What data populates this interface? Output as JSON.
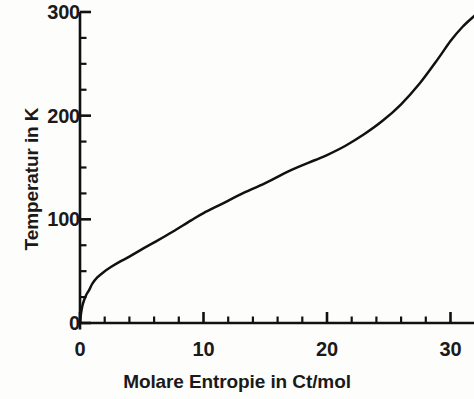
{
  "chart_data": {
    "type": "line",
    "title": "",
    "subtitle": "",
    "xlabel": "Molare Entropie in Ct/mol",
    "ylabel": "Temperatur in K",
    "xlim": [
      0,
      32
    ],
    "ylim": [
      0,
      300
    ],
    "grid": false,
    "legend": null,
    "x_major_ticks": [
      0,
      10,
      20,
      30
    ],
    "x_major_tick_labels": [
      "0",
      "10",
      "20",
      "30"
    ],
    "x_minor_tick_step": 2,
    "y_major_ticks": [
      0,
      100,
      200,
      300
    ],
    "y_major_tick_labels": [
      "0",
      "100",
      "200",
      "300"
    ],
    "y_minor_tick_step": 25,
    "line_color": "#111111",
    "background_color": "#fdfdfc",
    "axis_color": "#111111",
    "series": [
      {
        "name": "Temperatur gegen molare Entropie",
        "x": [
          0,
          0.08,
          0.18,
          0.3,
          0.5,
          0.75,
          1.0,
          1.4,
          1.9,
          2.5,
          3.2,
          4.0,
          5.0,
          6.2,
          7.5,
          9.0,
          10.0,
          11.5,
          13.0,
          15.0,
          17.0,
          19.0,
          20.0,
          21.5,
          23.0,
          24.5,
          26.0,
          27.5,
          29.0,
          30.0,
          31.0,
          32.0
        ],
        "y": [
          0,
          9,
          16,
          21,
          27,
          32,
          38,
          44,
          49,
          54,
          59,
          64,
          71,
          79,
          88,
          99,
          106,
          115,
          124,
          135,
          147,
          157,
          162,
          171,
          182,
          195,
          211,
          231,
          255,
          272,
          286,
          297
        ]
      }
    ]
  },
  "axes_geometry": {
    "origin_x_px": 80,
    "origin_y_px": 323,
    "x_per_unit_px": 12.35,
    "y_per_unit_px": 1.0367,
    "plot_right_px": 474,
    "plot_top_px": 12
  },
  "tick_labels": {
    "y": [
      {
        "text": "300",
        "value": 300
      },
      {
        "text": "200",
        "value": 200
      },
      {
        "text": "100",
        "value": 100
      },
      {
        "text": "0",
        "value": 0
      }
    ],
    "x": [
      {
        "text": "0",
        "value": 0
      },
      {
        "text": "10",
        "value": 10
      },
      {
        "text": "20",
        "value": 20
      },
      {
        "text": "30",
        "value": 30
      }
    ]
  }
}
